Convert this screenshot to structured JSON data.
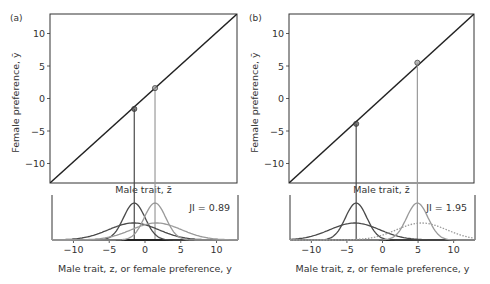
{
  "chart_data": [
    {
      "panel": "(a)",
      "type": "line",
      "upper": {
        "xlabel": "Male trait, z̄",
        "ylabel": "Female preference, ȳ",
        "ylim": [
          -13,
          13
        ],
        "xlim": [
          -13,
          13
        ],
        "yticks": [
          -10,
          -5,
          0,
          5,
          10
        ],
        "line": "y = z (identity)",
        "points": [
          {
            "z": -1.6,
            "y": -1.6,
            "shade": "dark"
          },
          {
            "z": 1.4,
            "y": 1.6,
            "shade": "light"
          }
        ]
      },
      "lower": {
        "xlabel": "Male trait, z, or female preference, y",
        "xticks": [
          -10,
          -5,
          0,
          5,
          10
        ],
        "xlim": [
          -13,
          13
        ],
        "annotation": "JI = 0.89",
        "series": [
          {
            "name": "male trait (dark, narrow)",
            "mean": -1.5,
            "sd": 1.5,
            "shade": "dark"
          },
          {
            "name": "female preference (dark, broad)",
            "mean": -1.6,
            "sd": 3.5,
            "shade": "dark"
          },
          {
            "name": "male trait (light, narrow)",
            "mean": 1.4,
            "sd": 1.5,
            "shade": "light"
          },
          {
            "name": "female preference (light, broad)",
            "mean": 1.6,
            "sd": 3.5,
            "shade": "light"
          }
        ]
      }
    },
    {
      "panel": "(b)",
      "type": "line",
      "upper": {
        "xlabel": "Male trait, z̄",
        "ylabel": "Female preference, ȳ",
        "ylim": [
          -13,
          13
        ],
        "xlim": [
          -13,
          13
        ],
        "yticks": [
          -10,
          -5,
          0,
          5,
          10
        ],
        "line": "y = z (identity)",
        "points": [
          {
            "z": -3.8,
            "y": -3.9,
            "shade": "dark"
          },
          {
            "z": 4.9,
            "y": 5.5,
            "shade": "light"
          }
        ]
      },
      "lower": {
        "xlabel": "Male trait, z, or female preference, y",
        "xticks": [
          -10,
          -5,
          0,
          5,
          10
        ],
        "xlim": [
          -13,
          13
        ],
        "annotation": "JI = 1.95",
        "series": [
          {
            "name": "male trait (dark, narrow)",
            "mean": -3.7,
            "sd": 1.5,
            "shade": "dark"
          },
          {
            "name": "female preference (dark, broad)",
            "mean": -3.9,
            "sd": 3.5,
            "shade": "dark"
          },
          {
            "name": "male trait (light, narrow)",
            "mean": 4.9,
            "sd": 1.5,
            "shade": "light"
          },
          {
            "name": "female preference (light, broad, dotted)",
            "mean": 5.5,
            "sd": 3.5,
            "shade": "light",
            "dashed": true
          }
        ]
      }
    }
  ],
  "labels": {
    "panel_a": "(a)",
    "panel_b": "(b)",
    "ylabel": "Female preference, ȳ",
    "upper_xlabel": "Male trait, z̄",
    "lower_xlabel": "Male trait, z, or female preference, y",
    "ji_a": "JI = 0.89",
    "ji_b": "JI = 1.95",
    "yticks": [
      "10",
      "5",
      "0",
      "−5",
      "−10"
    ],
    "xticks": [
      "−10",
      "−5",
      "0",
      "5",
      "10"
    ]
  },
  "colors": {
    "dark": "#4a4a4a",
    "light": "#9a9a9a",
    "axis": "#333333"
  }
}
